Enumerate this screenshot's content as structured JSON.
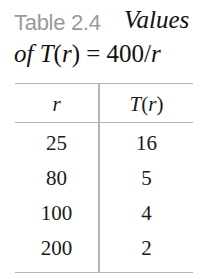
{
  "caption": {
    "label": "Table 2.4",
    "title_line1": "Values",
    "title_line2_prefix": "of ",
    "title_line2_func": "T",
    "title_line2_arg_open": "(",
    "title_line2_arg": "r",
    "title_line2_arg_close": ")",
    "title_line2_eq": " = 400/",
    "title_line2_var": "r"
  },
  "table": {
    "headers": [
      "r",
      "T(r)"
    ],
    "rows": [
      [
        "25",
        "16"
      ],
      [
        "80",
        "5"
      ],
      [
        "100",
        "4"
      ],
      [
        "200",
        "2"
      ]
    ]
  }
}
